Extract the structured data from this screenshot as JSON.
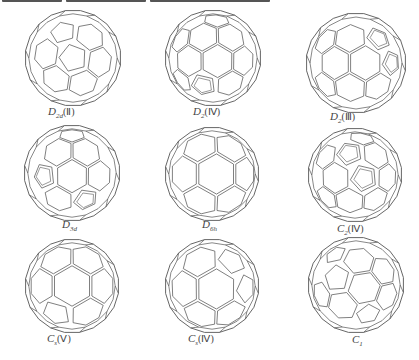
{
  "figure": {
    "top_caption_cropped": true,
    "stroke_color": "#555555",
    "background": "#ffffff",
    "cages": [
      {
        "id": "d2d-ii",
        "main": "D",
        "sub": "2d",
        "paren": "(Ⅱ)",
        "cx": 73,
        "cy": 58,
        "r": 48,
        "style": "pentagons-star"
      },
      {
        "id": "d2-iv",
        "main": "D",
        "sub": "2",
        "paren": "(Ⅳ)",
        "cx": 213,
        "cy": 58,
        "r": 48,
        "style": "double-lines"
      },
      {
        "id": "d2-iii",
        "main": "D",
        "sub": "2",
        "paren": "(Ⅲ)",
        "cx": 356,
        "cy": 63,
        "r": 50,
        "style": "double-lines"
      },
      {
        "id": "d3d",
        "main": "D",
        "sub": "3d",
        "paren": "",
        "cx": 72,
        "cy": 173,
        "r": 48,
        "style": "double-lines"
      },
      {
        "id": "d6h",
        "main": "D",
        "sub": "6h",
        "paren": "",
        "cx": 212,
        "cy": 174,
        "r": 47,
        "style": "hex-center"
      },
      {
        "id": "c2-iv",
        "main": "C",
        "sub": "2",
        "paren": "(Ⅳ)",
        "cx": 355,
        "cy": 175,
        "r": 47,
        "style": "double-lines"
      },
      {
        "id": "cs-v",
        "main": "C",
        "sub": "s",
        "paren": "(Ⅴ)",
        "cx": 72,
        "cy": 286,
        "r": 47,
        "style": "hex-center"
      },
      {
        "id": "cs-iv",
        "main": "C",
        "sub": "s",
        "paren": "(Ⅳ)",
        "cx": 212,
        "cy": 286,
        "r": 47,
        "style": "hex-center"
      },
      {
        "id": "c1",
        "main": "C",
        "sub": "1",
        "paren": "",
        "cx": 356,
        "cy": 285,
        "r": 48,
        "style": "tilted"
      }
    ],
    "labels_pos": [
      {
        "x": 48,
        "y": 105
      },
      {
        "x": 193,
        "y": 105
      },
      {
        "x": 330,
        "y": 110
      },
      {
        "x": 62,
        "y": 218
      },
      {
        "x": 202,
        "y": 218
      },
      {
        "x": 337,
        "y": 222
      },
      {
        "x": 47,
        "y": 332
      },
      {
        "x": 188,
        "y": 332
      },
      {
        "x": 352,
        "y": 333
      }
    ]
  }
}
